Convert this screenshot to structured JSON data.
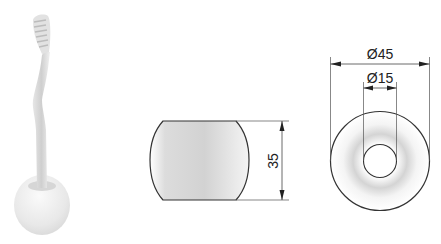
{
  "figure": {
    "views": [
      {
        "id": "product-photo",
        "label": "Toothbrush in holder (rendered view)"
      },
      {
        "id": "side-view",
        "label": "Side view of holder"
      },
      {
        "id": "top-view",
        "label": "Top view of holder"
      }
    ],
    "dimensions": {
      "height": "35",
      "outer_diameter": "Ø45",
      "inner_diameter": "Ø15"
    },
    "colors": {
      "outline": "#333333",
      "dimension_line": "#444444",
      "fill_light": "#f2f2f2",
      "fill_shade": "#c9c9c9"
    }
  }
}
